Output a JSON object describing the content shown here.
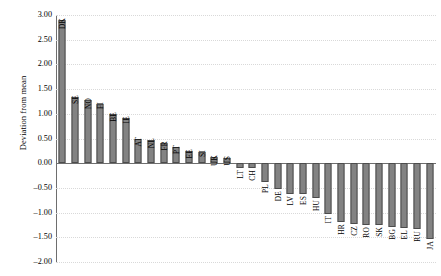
{
  "chart_data": {
    "type": "bar",
    "title": "",
    "xlabel": "",
    "ylabel": "Deviation from mean",
    "ylim": [
      -2.0,
      3.0
    ],
    "ytick_labels": [
      "3.00",
      "2.50",
      "2.00",
      "1.50",
      "1.00",
      "0.50",
      "0.00",
      "–0.50",
      "–1.00",
      "–1.50",
      "–2.00"
    ],
    "ytick_values": [
      3.0,
      2.5,
      2.0,
      1.5,
      1.0,
      0.5,
      0.0,
      -0.5,
      -1.0,
      -1.5,
      -2.0
    ],
    "grid": true,
    "legend": "none",
    "bar_color": "#838383",
    "bar_edge_color": "#4c4c4c",
    "grid_color": "#d9d9d9",
    "axis_color": "#6e6e6e",
    "categories": [
      "DK",
      "SE",
      "NO",
      "FI",
      "BE",
      "IE",
      "AT",
      "NL",
      "FR",
      "PT",
      "EE",
      "SI",
      "UK",
      "US",
      "LT",
      "CH",
      "PL",
      "DE",
      "LV",
      "ES",
      "HU",
      "IT",
      "HR",
      "CZ",
      "RO",
      "SK",
      "BG",
      "EL",
      "RU",
      "JA"
    ],
    "values": [
      2.9,
      1.35,
      1.27,
      1.19,
      1.0,
      0.91,
      0.5,
      0.47,
      0.4,
      0.32,
      0.24,
      0.22,
      0.12,
      0.11,
      -0.09,
      -0.1,
      -0.38,
      -0.52,
      -0.62,
      -0.62,
      -0.7,
      -1.02,
      -1.2,
      -1.24,
      -1.25,
      -1.26,
      -1.3,
      -1.31,
      -1.33,
      -1.53
    ]
  }
}
